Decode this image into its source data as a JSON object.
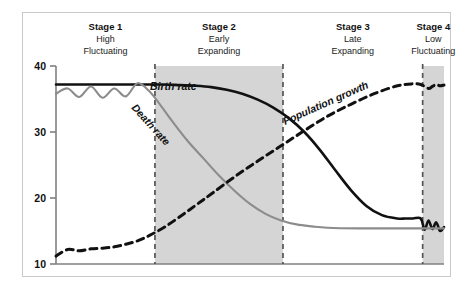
{
  "figure": {
    "background": "#ffffff",
    "frame_color": "#c9c9c9",
    "shade_color": "#d5d5d5",
    "axis_color": "#808080",
    "birth_color": "#111111",
    "death_color": "#8c8c8c",
    "growth_color": "#111111"
  },
  "axis": {
    "y_ticks": [
      "40",
      "30",
      "20",
      "10"
    ],
    "y_tick_values": [
      40,
      30,
      20,
      10
    ],
    "ylim": [
      10,
      40
    ],
    "xlim": [
      0,
      100
    ]
  },
  "stages": [
    {
      "title": "Stage 1",
      "line1": "High",
      "line2": "Fluctuating",
      "shaded": false,
      "x_start": 0,
      "x_end": 25.5
    },
    {
      "title": "Stage 2",
      "line1": "Early",
      "line2": "Expanding",
      "shaded": true,
      "x_start": 25.5,
      "x_end": 58.5
    },
    {
      "title": "Stage 3",
      "line1": "Late",
      "line2": "Expanding",
      "shaded": false,
      "x_start": 58.5,
      "x_end": 94.5
    },
    {
      "title": "Stage 4",
      "line1": "Low",
      "line2": "Fluctuating",
      "shaded": true,
      "x_start": 94.5,
      "x_end": 100
    }
  ],
  "curve_labels": [
    {
      "name": "birth-rate-label",
      "text": "Birth rate",
      "rotation": 0
    },
    {
      "name": "death-rate-label",
      "text": "Death rate",
      "rotation": 48
    },
    {
      "name": "population-growth-label",
      "text": "Population growth",
      "rotation": -24
    }
  ],
  "chart_data": {
    "type": "line",
    "xlabel": "",
    "ylabel": "",
    "ylim": [
      10,
      40
    ],
    "xlim": [
      0,
      100
    ],
    "grid": false,
    "legend": "inline-curve-labels",
    "ytick_labels": [
      "10",
      "20",
      "30",
      "40"
    ],
    "categories": [
      "Stage 1 High Fluctuating",
      "Stage 2 Early Expanding",
      "Stage 3 Late Expanding",
      "Stage 4 Low Fluctuating"
    ],
    "stage_boundaries_x": [
      25.5,
      58.5,
      94.5
    ],
    "series": [
      {
        "name": "Birth rate",
        "style": "solid",
        "color": "#111111",
        "x": [
          0,
          4,
          8,
          12,
          16,
          20,
          24,
          28,
          32,
          36,
          40,
          44,
          48,
          52,
          56,
          60,
          64,
          68,
          72,
          76,
          80,
          84,
          88,
          90,
          92,
          94,
          95,
          96,
          97,
          98,
          99,
          100
        ],
        "values": [
          37.2,
          37.2,
          37.2,
          37.2,
          37.2,
          37.2,
          37.2,
          37.2,
          37.1,
          37.0,
          36.8,
          36.4,
          35.8,
          34.9,
          33.7,
          32.1,
          30.0,
          27.3,
          24.2,
          21.2,
          18.8,
          17.4,
          16.9,
          16.9,
          16.9,
          16.9,
          15.2,
          16.6,
          15.3,
          16.3,
          15.0,
          15.6
        ]
      },
      {
        "name": "Death rate",
        "style": "solid",
        "color": "#8c8c8c",
        "x": [
          0,
          3,
          6,
          9,
          12,
          15,
          18,
          21,
          24,
          27,
          30,
          34,
          38,
          42,
          46,
          50,
          54,
          58,
          62,
          66,
          70,
          78,
          86,
          94,
          100
        ],
        "values": [
          35.8,
          36.6,
          35.3,
          36.9,
          35.2,
          36.6,
          35.4,
          37.4,
          36.2,
          34.0,
          31.6,
          28.6,
          26.0,
          23.4,
          21.1,
          19.1,
          17.6,
          16.6,
          16.0,
          15.7,
          15.5,
          15.4,
          15.4,
          15.4,
          15.4
        ]
      },
      {
        "name": "Population growth",
        "style": "dashed",
        "color": "#111111",
        "x": [
          0,
          3,
          6,
          9,
          12,
          15,
          18,
          21,
          24,
          28,
          32,
          36,
          40,
          46,
          52,
          58,
          64,
          70,
          76,
          82,
          88,
          92,
          94,
          96,
          97,
          98,
          99,
          100
        ],
        "values": [
          11.2,
          12.2,
          12.0,
          12.3,
          12.4,
          12.6,
          13.0,
          13.5,
          14.3,
          15.6,
          17.2,
          18.9,
          20.6,
          23.2,
          25.6,
          27.9,
          30.2,
          32.4,
          34.2,
          35.8,
          37.0,
          37.3,
          37.2,
          36.6,
          36.9,
          37.2,
          37.0,
          37.1
        ]
      }
    ]
  }
}
